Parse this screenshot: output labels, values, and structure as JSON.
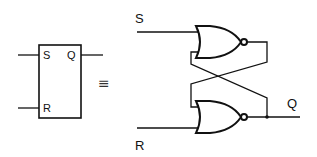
{
  "diagram": {
    "symbol": {
      "inputs": [
        "S",
        "R"
      ],
      "output": "Q"
    },
    "equivalence_sign": "≡",
    "circuit": {
      "input_top": "S",
      "input_bottom": "R",
      "output": "Q",
      "gates": [
        "NOR",
        "NOR"
      ]
    }
  }
}
